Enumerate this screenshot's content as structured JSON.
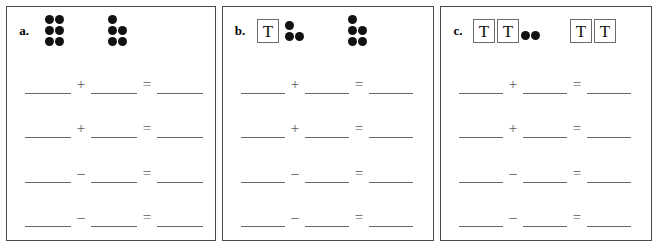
{
  "worksheet": {
    "panels": [
      {
        "label": "a.",
        "groups": [
          {
            "kind": "dots",
            "count": 6,
            "pattern": [
              2,
              2,
              2
            ]
          },
          {
            "kind": "dots",
            "count": 5,
            "pattern": [
              1,
              2,
              2
            ]
          }
        ],
        "equations": [
          {
            "operator": "+",
            "equals": "=",
            "blanks": [
              "",
              "",
              ""
            ]
          },
          {
            "operator": "+",
            "equals": "=",
            "blanks": [
              "",
              "",
              ""
            ]
          },
          {
            "operator": "–",
            "equals": "=",
            "blanks": [
              "",
              "",
              ""
            ]
          },
          {
            "operator": "–",
            "equals": "=",
            "blanks": [
              "",
              "",
              ""
            ]
          }
        ]
      },
      {
        "label": "b.",
        "groups": [
          {
            "kind": "mixed",
            "rods": 1,
            "rod_glyph": "T",
            "count": 3,
            "pattern": [
              1,
              2
            ]
          },
          {
            "kind": "dots",
            "count": 5,
            "pattern": [
              1,
              2,
              2
            ]
          }
        ],
        "equations": [
          {
            "operator": "+",
            "equals": "=",
            "blanks": [
              "",
              "",
              ""
            ]
          },
          {
            "operator": "+",
            "equals": "=",
            "blanks": [
              "",
              "",
              ""
            ]
          },
          {
            "operator": "–",
            "equals": "=",
            "blanks": [
              "",
              "",
              ""
            ]
          },
          {
            "operator": "–",
            "equals": "=",
            "blanks": [
              "",
              "",
              ""
            ]
          }
        ]
      },
      {
        "label": "c.",
        "groups": [
          {
            "kind": "mixed",
            "rods": 2,
            "rod_glyph": "T",
            "count": 2,
            "pattern": [
              2
            ]
          },
          {
            "kind": "rods",
            "rods": 2,
            "rod_glyph": "T",
            "count": 0,
            "pattern": []
          }
        ],
        "equations": [
          {
            "operator": "+",
            "equals": "=",
            "blanks": [
              "",
              "",
              ""
            ]
          },
          {
            "operator": "+",
            "equals": "=",
            "blanks": [
              "",
              "",
              ""
            ]
          },
          {
            "operator": "–",
            "equals": "=",
            "blanks": [
              "",
              "",
              ""
            ]
          },
          {
            "operator": "–",
            "equals": "=",
            "blanks": [
              "",
              "",
              ""
            ]
          }
        ]
      }
    ]
  }
}
